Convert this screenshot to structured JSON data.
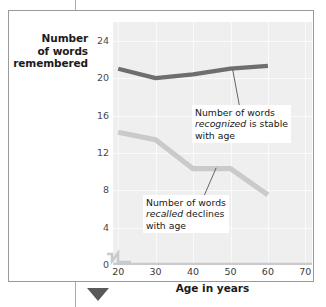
{
  "figure": {
    "bottom_marker_color": "#595959",
    "frame_color": "#9a9a9a",
    "plot_background": "#efefef"
  },
  "chart_data": {
    "type": "line",
    "title": "",
    "xlabel": "Age in years",
    "ylabel": "Number of words remembered",
    "ylabel_lines": [
      "Number",
      "of words",
      "remembered"
    ],
    "x": [
      20,
      30,
      40,
      50,
      60
    ],
    "xticks": [
      20,
      30,
      40,
      50,
      60,
      70
    ],
    "yticks": [
      0,
      4,
      8,
      12,
      16,
      20,
      24
    ],
    "xlim": [
      20,
      70
    ],
    "ylim": [
      0,
      26
    ],
    "grid": true,
    "legend": "none",
    "axis_break": "x-axis break between 0 and 20",
    "series": [
      {
        "name": "recognized",
        "color": "#6e6e6e",
        "values": [
          21.0,
          20.0,
          20.4,
          21.0,
          21.3
        ]
      },
      {
        "name": "recalled",
        "color": "#cacaca",
        "values": [
          14.2,
          13.4,
          10.3,
          10.3,
          7.5
        ]
      }
    ],
    "annotations": [
      {
        "id": "recognized",
        "line1": "Number of words",
        "line2_italic": "recognized",
        "line2_rest": " is stable",
        "line3": "with age"
      },
      {
        "id": "recalled",
        "line1": "Number of words",
        "line2_italic": "recalled",
        "line2_rest": " declines",
        "line3": "with age"
      }
    ]
  },
  "axis": {
    "ytick_labels": [
      "24",
      "20",
      "16",
      "12",
      "8",
      "4",
      "0"
    ],
    "xtick_labels": [
      "20",
      "30",
      "40",
      "50",
      "60",
      "70"
    ]
  }
}
